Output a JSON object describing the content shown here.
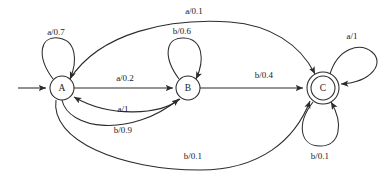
{
  "figure": {
    "background_color": "#ffffff",
    "stroke_color": "#2b2b2b",
    "text_color": "#1a1a1a",
    "width": 392,
    "height": 176
  },
  "start_marker": {
    "name": "start-arrow",
    "target_state": "A"
  },
  "states": [
    {
      "id": "A",
      "label": "A",
      "cx": 62,
      "cy": 88,
      "r": 12,
      "accepting": false
    },
    {
      "id": "B",
      "label": "B",
      "cx": 188,
      "cy": 88,
      "r": 12,
      "accepting": false
    },
    {
      "id": "C",
      "label": "C",
      "cx": 323,
      "cy": 88,
      "r": 12,
      "accepting": true,
      "outer_r": 16
    }
  ],
  "transitions": [
    {
      "id": "a-self",
      "from": "A",
      "to": "A",
      "symbol": "a",
      "probability": "0.7",
      "label": "a/0.7",
      "lx": 56,
      "ly": 33
    },
    {
      "id": "a-to-b",
      "from": "A",
      "to": "B",
      "symbol": "a",
      "probability": "0.2",
      "label": "a/0.2",
      "lx": 125,
      "ly": 79
    },
    {
      "id": "a-to-c",
      "from": "A",
      "to": "C",
      "symbol": "a",
      "probability": "0.1",
      "label": "a/0.1",
      "lx": 194,
      "ly": 12
    },
    {
      "id": "b-to-b-from-a",
      "from": "A",
      "to": "B",
      "symbol": "b",
      "probability": "0.9",
      "label": "b/0.9",
      "lx": 123,
      "ly": 131
    },
    {
      "id": "b-to-c-from-a",
      "from": "A",
      "to": "C",
      "symbol": "b",
      "probability": "0.1",
      "label": "b/0.1",
      "lx": 193,
      "ly": 157
    },
    {
      "id": "b-self",
      "from": "B",
      "to": "B",
      "symbol": "b",
      "probability": "0.6",
      "label": "b/0.6",
      "lx": 182,
      "ly": 32
    },
    {
      "id": "a-b-to-a",
      "from": "B",
      "to": "A",
      "symbol": "a",
      "probability": "1",
      "label": "a/1",
      "lx": 123,
      "ly": 110
    },
    {
      "id": "b-b-to-c",
      "from": "B",
      "to": "C",
      "symbol": "b",
      "probability": "0.4",
      "label": "b/0.4",
      "lx": 264,
      "ly": 76
    },
    {
      "id": "a-c-self",
      "from": "C",
      "to": "C",
      "symbol": "a",
      "probability": "1",
      "label": "a/1",
      "lx": 352,
      "ly": 37
    },
    {
      "id": "b-c-self",
      "from": "C",
      "to": "C",
      "symbol": "b",
      "probability": "0.1",
      "label": "b/0.1",
      "lx": 320,
      "ly": 157
    }
  ]
}
